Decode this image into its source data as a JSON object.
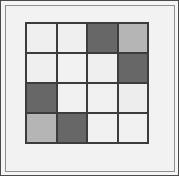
{
  "figure": {
    "kind": "grid-pattern",
    "rows": 4,
    "cols": 4,
    "canvas_background": "#f5f5f5",
    "mat_background": "#f2f2f2",
    "outer_border_color": "#4a4a4a",
    "mat_border_color": "#8f8f8f",
    "gridline_color": "#3c3c3c"
  },
  "palette": {
    "light": "#efefef",
    "medium": "#b5b5b5",
    "dark": "#676767"
  },
  "chart_data": {
    "type": "heatmap",
    "title": "",
    "subtitle": "",
    "xlabel": "",
    "ylabel": "",
    "grid": true,
    "legend_position": "none",
    "x": [
      "1",
      "2",
      "3",
      "4"
    ],
    "categories": [
      "1",
      "2",
      "3",
      "4"
    ],
    "row_labels": [
      "1",
      "2",
      "3",
      "4"
    ],
    "col_labels": [
      "1",
      "2",
      "3",
      "4"
    ],
    "xtick_labels": [],
    "ytick_labels": [],
    "value_scale": {
      "light": 0,
      "medium": 1,
      "dark": 2
    },
    "values": [
      [
        0,
        0,
        2,
        1
      ],
      [
        0,
        0,
        0,
        2
      ],
      [
        2,
        0,
        0,
        0
      ],
      [
        1,
        2,
        0,
        0
      ]
    ],
    "annotations": []
  },
  "cells": [
    {
      "row": 1,
      "col": 1,
      "shade": "light",
      "color": "#efefef",
      "value": 0
    },
    {
      "row": 1,
      "col": 2,
      "shade": "light",
      "color": "#efefef",
      "value": 0
    },
    {
      "row": 1,
      "col": 3,
      "shade": "dark",
      "color": "#676767",
      "value": 2
    },
    {
      "row": 1,
      "col": 4,
      "shade": "medium",
      "color": "#b5b5b5",
      "value": 1
    },
    {
      "row": 2,
      "col": 1,
      "shade": "light",
      "color": "#efefef",
      "value": 0
    },
    {
      "row": 2,
      "col": 2,
      "shade": "light",
      "color": "#f2f2f2",
      "value": 0
    },
    {
      "row": 2,
      "col": 3,
      "shade": "light",
      "color": "#efefef",
      "value": 0
    },
    {
      "row": 2,
      "col": 4,
      "shade": "dark",
      "color": "#676767",
      "value": 2
    },
    {
      "row": 3,
      "col": 1,
      "shade": "dark",
      "color": "#676767",
      "value": 2
    },
    {
      "row": 3,
      "col": 2,
      "shade": "light",
      "color": "#f0f0f0",
      "value": 0
    },
    {
      "row": 3,
      "col": 3,
      "shade": "light",
      "color": "#f0f0f0",
      "value": 0
    },
    {
      "row": 3,
      "col": 4,
      "shade": "light",
      "color": "#ededed",
      "value": 0
    },
    {
      "row": 4,
      "col": 1,
      "shade": "medium",
      "color": "#b5b5b5",
      "value": 1
    },
    {
      "row": 4,
      "col": 2,
      "shade": "dark",
      "color": "#676767",
      "value": 2
    },
    {
      "row": 4,
      "col": 3,
      "shade": "light",
      "color": "#f0f0f0",
      "value": 0
    },
    {
      "row": 4,
      "col": 4,
      "shade": "light",
      "color": "#f0f0f0",
      "value": 0
    }
  ]
}
